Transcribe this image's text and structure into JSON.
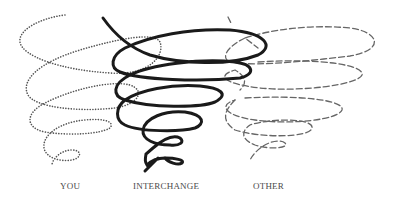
{
  "diagram": {
    "type": "spiral-comparison",
    "labels": {
      "you": "YOU",
      "interchange": "INTERCHANGE",
      "other": "OTHER"
    },
    "series": [
      {
        "name": "YOU",
        "style": "dotted",
        "color": "#555555",
        "position": "left"
      },
      {
        "name": "INTERCHANGE",
        "style": "solid",
        "color": "#1a1a1a",
        "position": "center"
      },
      {
        "name": "OTHER",
        "style": "dashed",
        "color": "#666666",
        "position": "right"
      }
    ]
  }
}
